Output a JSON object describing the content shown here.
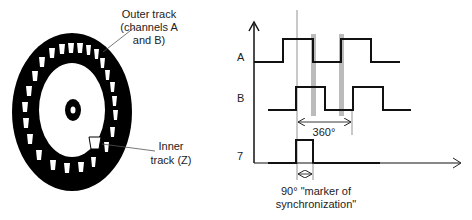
{
  "disc": {
    "outer_label_line1": "Outer track",
    "outer_label_line2": "(channels A",
    "outer_label_line3": "and B)",
    "inner_label_line1": "Inner",
    "inner_label_line2": "track (Z)"
  },
  "timing": {
    "channel_a_label": "A",
    "channel_b_label": "B",
    "channel_z_label": "7",
    "period_label": "360°",
    "marker_label_line1": "90° \"marker of",
    "marker_label_line2": "synchronization\""
  },
  "colors": {
    "ink": "#111111",
    "gray_bar": "#bbbbbb",
    "thin_line": "#777777"
  }
}
